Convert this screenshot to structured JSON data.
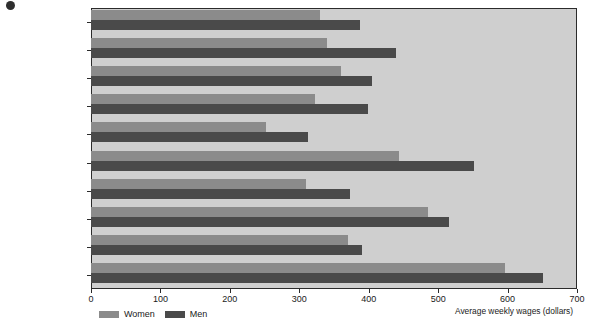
{
  "chart_data": {
    "type": "bar",
    "orientation": "horizontal",
    "title": "",
    "xlabel": "Average weekly wages (dollars)",
    "ylabel": "",
    "xlim": [
      0,
      700
    ],
    "xticks": [
      0,
      100,
      200,
      300,
      400,
      500,
      600,
      700
    ],
    "grid": false,
    "legend_position": "bottom-left",
    "plot_background": "#cfcfcf",
    "categories": [
      "Accounting clerk",
      "Bookkeeper",
      "Computer operator",
      "Cost clerk",
      "File clerk",
      "Office Manager",
      "Order clerk",
      "Programmer",
      "Secretary",
      "Systems analyst"
    ],
    "series": [
      {
        "name": "Women",
        "color": "#8b8b8b",
        "values": [
          330,
          340,
          360,
          322,
          252,
          443,
          310,
          486,
          370,
          597
        ]
      },
      {
        "name": "Men",
        "color": "#4a4a4a",
        "values": [
          388,
          440,
          405,
          399,
          313,
          551,
          373,
          515,
          390,
          651
        ]
      }
    ]
  },
  "legend": {
    "items": [
      {
        "label": "Women",
        "color": "#8b8b8b"
      },
      {
        "label": "Men",
        "color": "#4a4a4a"
      }
    ]
  }
}
